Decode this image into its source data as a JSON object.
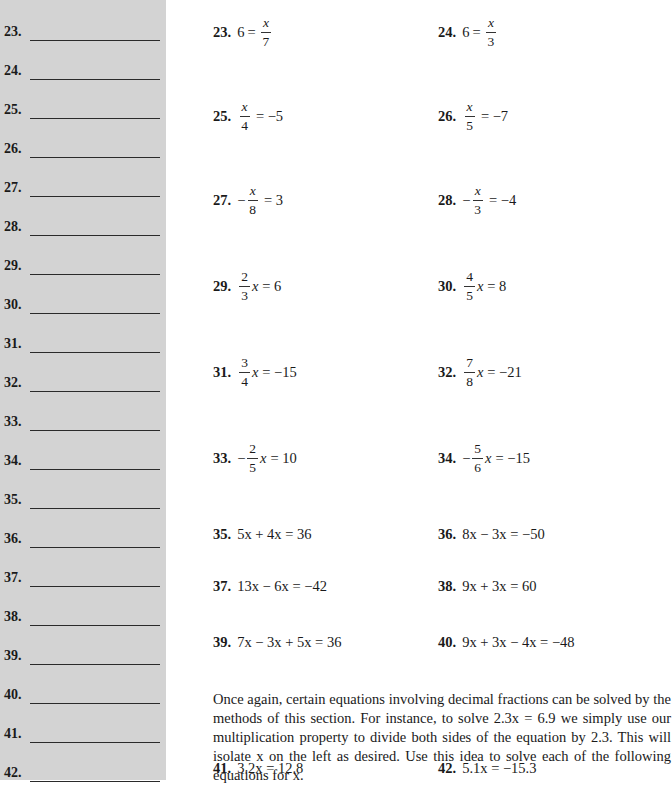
{
  "answer_column": {
    "rows": [
      {
        "num": "23.",
        "top": 22
      },
      {
        "num": "24.",
        "top": 61
      },
      {
        "num": "25.",
        "top": 100
      },
      {
        "num": "26.",
        "top": 139
      },
      {
        "num": "27.",
        "top": 178
      },
      {
        "num": "28.",
        "top": 217
      },
      {
        "num": "29.",
        "top": 256
      },
      {
        "num": "30.",
        "top": 295
      },
      {
        "num": "31.",
        "top": 334
      },
      {
        "num": "32.",
        "top": 373
      },
      {
        "num": "33.",
        "top": 412
      },
      {
        "num": "34.",
        "top": 451
      },
      {
        "num": "35.",
        "top": 490
      },
      {
        "num": "36.",
        "top": 529
      },
      {
        "num": "37.",
        "top": 568
      },
      {
        "num": "38.",
        "top": 607
      },
      {
        "num": "39.",
        "top": 646
      },
      {
        "num": "40.",
        "top": 685
      },
      {
        "num": "41.",
        "top": 724
      },
      {
        "num": "42.",
        "top": 763
      }
    ]
  },
  "problems": {
    "p23": {
      "num": "23.",
      "lhs": "6",
      "eq": "=",
      "frac_n": "x",
      "frac_d": "7"
    },
    "p24": {
      "num": "24.",
      "lhs": "6",
      "eq": "=",
      "frac_n": "x",
      "frac_d": "3"
    },
    "p25": {
      "num": "25.",
      "frac_n": "x",
      "frac_d": "4",
      "rhs": "= −5"
    },
    "p26": {
      "num": "26.",
      "frac_n": "x",
      "frac_d": "5",
      "rhs": "= −7"
    },
    "p27": {
      "num": "27.",
      "sign": "−",
      "frac_n": "x",
      "frac_d": "8",
      "rhs": "= 3"
    },
    "p28": {
      "num": "28.",
      "sign": "−",
      "frac_n": "x",
      "frac_d": "3",
      "rhs": "= −4"
    },
    "p29": {
      "num": "29.",
      "frac_n": "2",
      "frac_d": "3",
      "var": "x",
      "rhs": "= 6"
    },
    "p30": {
      "num": "30.",
      "frac_n": "4",
      "frac_d": "5",
      "var": "x",
      "rhs": "= 8"
    },
    "p31": {
      "num": "31.",
      "frac_n": "3",
      "frac_d": "4",
      "var": "x",
      "rhs": "= −15"
    },
    "p32": {
      "num": "32.",
      "frac_n": "7",
      "frac_d": "8",
      "var": "x",
      "rhs": "= −21"
    },
    "p33": {
      "num": "33.",
      "sign": "−",
      "frac_n": "2",
      "frac_d": "5",
      "var": "x",
      "rhs": "= 10"
    },
    "p34": {
      "num": "34.",
      "sign": "−",
      "frac_n": "5",
      "frac_d": "6",
      "var": "x",
      "rhs": "= −15"
    },
    "p35": {
      "num": "35.",
      "expr": "5x + 4x = 36"
    },
    "p36": {
      "num": "36.",
      "expr": "8x − 3x = −50"
    },
    "p37": {
      "num": "37.",
      "expr": "13x − 6x = −42"
    },
    "p38": {
      "num": "38.",
      "expr": "9x + 3x = 60"
    },
    "p39": {
      "num": "39.",
      "expr": "7x − 3x + 5x = 36"
    },
    "p40": {
      "num": "40.",
      "expr": "9x + 3x − 4x = −48"
    },
    "p41": {
      "num": "41.",
      "expr": "3.2x = 12.8"
    },
    "p42": {
      "num": "42.",
      "expr": "5.1x = −15.3"
    }
  },
  "instructions": {
    "text": "Once again, certain equations involving decimal fractions can be solved by the methods of this section. For instance, to solve 2.3x = 6.9 we simply use our multiplication property to divide both sides of the equation by 2.3. This will isolate x on the left as desired. Use this idea to solve each of the following equations for x."
  }
}
